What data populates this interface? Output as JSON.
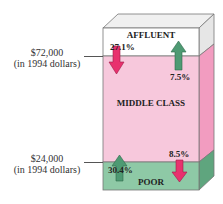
{
  "diagram": {
    "bands": {
      "affluent": {
        "label": "AFFLUENT",
        "color": "#ffffff"
      },
      "middle": {
        "label": "MIDDLE CLASS",
        "color": "#f7c8dc"
      },
      "poor": {
        "label": "POOR",
        "color": "#8ec9a6"
      }
    },
    "thresholds": {
      "upper": {
        "amount": "$72,000",
        "note": "(in 1994 dollars)"
      },
      "lower": {
        "amount": "$24,000",
        "note": "(in 1994 dollars)"
      }
    },
    "flows": {
      "affluent_down": {
        "value": "27.1%",
        "direction": "down",
        "color": "#e8316e"
      },
      "middle_up": {
        "value": "7.5%",
        "direction": "up",
        "color": "#4e9a73"
      },
      "poor_up": {
        "value": "30.4%",
        "direction": "up",
        "color": "#4e9a73"
      },
      "middle_down": {
        "value": "8.5%",
        "direction": "down",
        "color": "#e8316e"
      }
    }
  }
}
